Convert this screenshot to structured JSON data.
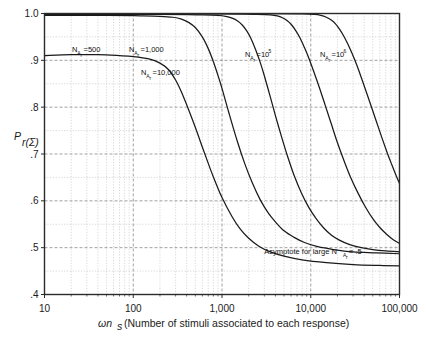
{
  "chart_data": {
    "type": "line",
    "title": "",
    "xlabel": "ωn_s (Number of stimuli associated to each response)",
    "ylabel": "P_r(Σ)",
    "xscale": "log",
    "yscale": "linear",
    "xlim": [
      10,
      100000
    ],
    "ylim": [
      0.4,
      1.0
    ],
    "xticks": [
      10,
      100,
      1000,
      10000,
      100000
    ],
    "xticklabels": [
      "10",
      "100",
      "1,000",
      "10,000",
      "100,000"
    ],
    "yticks": [
      0.4,
      0.5,
      0.6,
      0.7,
      0.8,
      0.9,
      1.0
    ],
    "yticklabels": [
      ".4",
      ".5",
      ".6",
      ".7",
      ".8",
      ".9",
      "1.0"
    ],
    "grid": true,
    "grid_minor": true,
    "legend_position": "inline-labels",
    "series": [
      {
        "name": "N_Ar = 500",
        "label_text": "N",
        "label_sub": "A",
        "label_sub2": "r",
        "label_eq": "=500",
        "points": [
          [
            10,
            0.91
          ],
          [
            20,
            0.912
          ],
          [
            40,
            0.912
          ],
          [
            70,
            0.91
          ],
          [
            100,
            0.908
          ],
          [
            150,
            0.903
          ],
          [
            200,
            0.894
          ],
          [
            250,
            0.88
          ],
          [
            300,
            0.858
          ],
          [
            350,
            0.832
          ],
          [
            400,
            0.805
          ],
          [
            500,
            0.757
          ],
          [
            600,
            0.715
          ],
          [
            700,
            0.68
          ],
          [
            800,
            0.651
          ],
          [
            1000,
            0.607
          ],
          [
            1300,
            0.566
          ],
          [
            1600,
            0.54
          ],
          [
            2000,
            0.52
          ],
          [
            2600,
            0.503
          ],
          [
            3500,
            0.491
          ],
          [
            5000,
            0.482
          ],
          [
            8000,
            0.474
          ],
          [
            15000,
            0.468
          ],
          [
            30000,
            0.464
          ],
          [
            60000,
            0.462
          ],
          [
            100000,
            0.461
          ]
        ]
      },
      {
        "name": "N_Ar = 1,000",
        "label_text": "N",
        "label_sub": "A",
        "label_sub2": "r",
        "label_eq": "=1,000",
        "points": [
          [
            10,
            0.996
          ],
          [
            50,
            0.996
          ],
          [
            120,
            0.995
          ],
          [
            200,
            0.994
          ],
          [
            280,
            0.992
          ],
          [
            350,
            0.988
          ],
          [
            420,
            0.981
          ],
          [
            500,
            0.97
          ],
          [
            600,
            0.95
          ],
          [
            700,
            0.925
          ],
          [
            800,
            0.897
          ],
          [
            900,
            0.868
          ],
          [
            1000,
            0.84
          ],
          [
            1200,
            0.787
          ],
          [
            1500,
            0.725
          ],
          [
            1800,
            0.68
          ],
          [
            2200,
            0.638
          ],
          [
            2700,
            0.602
          ],
          [
            3300,
            0.575
          ],
          [
            4000,
            0.555
          ],
          [
            5000,
            0.536
          ],
          [
            6500,
            0.522
          ],
          [
            8500,
            0.511
          ],
          [
            12000,
            0.502
          ],
          [
            18000,
            0.496
          ],
          [
            30000,
            0.491
          ],
          [
            55000,
            0.489
          ],
          [
            100000,
            0.487
          ]
        ]
      },
      {
        "name": "N_Ar = 10,000",
        "label_text": "N",
        "label_sub": "A",
        "label_sub2": "r",
        "label_eq": "=10,000",
        "points": [
          [
            10,
            0.998
          ],
          [
            200,
            0.998
          ],
          [
            600,
            0.997
          ],
          [
            900,
            0.996
          ],
          [
            1100,
            0.994
          ],
          [
            1300,
            0.99
          ],
          [
            1500,
            0.984
          ],
          [
            1700,
            0.975
          ],
          [
            1900,
            0.963
          ],
          [
            2100,
            0.948
          ],
          [
            2400,
            0.922
          ],
          [
            2700,
            0.895
          ],
          [
            3000,
            0.867
          ],
          [
            3500,
            0.822
          ],
          [
            4000,
            0.782
          ],
          [
            4700,
            0.736
          ],
          [
            5500,
            0.694
          ],
          [
            6500,
            0.654
          ],
          [
            7800,
            0.618
          ],
          [
            9500,
            0.586
          ],
          [
            11500,
            0.562
          ],
          [
            14000,
            0.542
          ],
          [
            17000,
            0.527
          ],
          [
            21000,
            0.516
          ],
          [
            27000,
            0.507
          ],
          [
            35000,
            0.501
          ],
          [
            50000,
            0.496
          ],
          [
            70000,
            0.493
          ],
          [
            100000,
            0.491
          ]
        ]
      },
      {
        "name": "N_Ar = 10^5",
        "label_text": "N",
        "label_sub": "A",
        "label_sub2": "r",
        "label_eq": "=10",
        "label_sup": "5",
        "points": [
          [
            10,
            0.999
          ],
          [
            1000,
            0.999
          ],
          [
            2500,
            0.998
          ],
          [
            3500,
            0.997
          ],
          [
            4200,
            0.995
          ],
          [
            4800,
            0.991
          ],
          [
            5400,
            0.985
          ],
          [
            6000,
            0.977
          ],
          [
            6800,
            0.963
          ],
          [
            7600,
            0.947
          ],
          [
            8500,
            0.927
          ],
          [
            9500,
            0.905
          ],
          [
            11000,
            0.872
          ],
          [
            12500,
            0.842
          ],
          [
            14500,
            0.805
          ],
          [
            17000,
            0.765
          ],
          [
            20000,
            0.724
          ],
          [
            24000,
            0.683
          ],
          [
            28000,
            0.651
          ],
          [
            34000,
            0.617
          ],
          [
            41000,
            0.588
          ],
          [
            50000,
            0.562
          ],
          [
            60000,
            0.543
          ],
          [
            72000,
            0.528
          ],
          [
            85000,
            0.517
          ],
          [
            100000,
            0.509
          ]
        ]
      },
      {
        "name": "N_Ar = 10^6",
        "label_text": "N",
        "label_sub": "A",
        "label_sub2": "r",
        "label_eq": "=10",
        "label_sup": "6",
        "points": [
          [
            10,
            0.9995
          ],
          [
            3000,
            0.9995
          ],
          [
            8000,
            0.999
          ],
          [
            11000,
            0.998
          ],
          [
            13000,
            0.996
          ],
          [
            15000,
            0.992
          ],
          [
            17000,
            0.986
          ],
          [
            19000,
            0.978
          ],
          [
            21000,
            0.967
          ],
          [
            23500,
            0.952
          ],
          [
            26000,
            0.936
          ],
          [
            29000,
            0.916
          ],
          [
            33000,
            0.89
          ],
          [
            37000,
            0.864
          ],
          [
            42000,
            0.834
          ],
          [
            48000,
            0.802
          ],
          [
            55000,
            0.769
          ],
          [
            63000,
            0.736
          ],
          [
            72000,
            0.705
          ],
          [
            82000,
            0.677
          ],
          [
            92000,
            0.653
          ],
          [
            100000,
            0.637
          ]
        ]
      }
    ],
    "annotations": [
      {
        "id": "asymptote-note",
        "text": "Asymptote for large N",
        "sub": "A",
        "sub2": "r",
        "tail": "= .5",
        "x": 3000,
        "y": 0.487
      }
    ]
  },
  "axis": {
    "y_title_main": "P",
    "y_title_sub": "r(Σ)",
    "x_title_main": "ωn",
    "x_title_sub": "s",
    "x_title_rest": "(Number of stimuli associated to each response)"
  },
  "colors": {
    "curve": "#1a1a1a",
    "frame": "#2b2b2b",
    "grid_major": "#8a8a8a",
    "grid_minor": "#bdbdbd",
    "text": "#1a1a1a",
    "background": "#ffffff"
  }
}
